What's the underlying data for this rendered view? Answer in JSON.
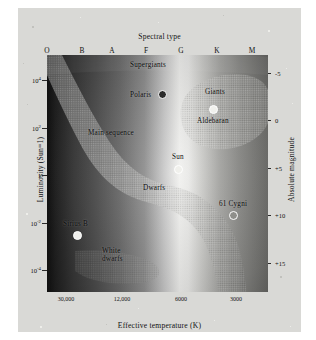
{
  "figure": {
    "kind": "hertzsprung-russell-diagram"
  },
  "axes": {
    "top_title": "Spectral type",
    "bottom_title": "Effective temperature (K)",
    "left_title": "Luminosity (Sun=1)",
    "right_title": "Absolute magnitude",
    "spectral_types": [
      "O",
      "B",
      "A",
      "F",
      "G",
      "K",
      "M"
    ],
    "left_ticks": [
      "10",
      "10",
      "1",
      "10",
      "10"
    ],
    "left_tick_exponents": [
      "4",
      "2",
      "",
      "-2",
      "-4"
    ],
    "right_ticks": [
      "-5",
      "0",
      "+5",
      "+10",
      "+15"
    ],
    "bottom_ticks": [
      "30,000",
      "12,000",
      "6000",
      "3000"
    ]
  },
  "regions": [
    {
      "name": "supergiants",
      "label": "Supergiants"
    },
    {
      "name": "giants",
      "label": "Giants"
    },
    {
      "name": "main-sequence",
      "label": "Main sequence"
    },
    {
      "name": "dwarfs",
      "label": "Dwarfs"
    },
    {
      "name": "white-dwarfs",
      "label": "White dwarfs"
    }
  ],
  "stars": [
    {
      "name": "polaris",
      "label": "Polaris"
    },
    {
      "name": "aldebaran",
      "label": "Aldebaran"
    },
    {
      "name": "sun",
      "label": "Sun"
    },
    {
      "name": "61-cygni",
      "label": "61 Cygni"
    },
    {
      "name": "sirius-b",
      "label": "Sirius B"
    }
  ],
  "chart_data": {
    "type": "scatter",
    "title": "Spectral type",
    "xlabel": "Effective temperature (K)",
    "ylabel": "Luminosity (Sun=1)",
    "y2label": "Absolute magnitude",
    "xlabel_top": "Spectral type",
    "grid": false,
    "legend": "none",
    "x_axis": {
      "scale": "log-reversed",
      "tick_labels": [
        "30,000",
        "12,000",
        "6000",
        "3000"
      ],
      "tick_values": [
        30000,
        12000,
        6000,
        3000
      ],
      "spectral_tick_labels": [
        "O",
        "B",
        "A",
        "F",
        "G",
        "K",
        "M"
      ],
      "range_k": [
        40000,
        2500
      ]
    },
    "y_axis": {
      "scale": "log",
      "tick_labels": [
        "10^4",
        "10^2",
        "1",
        "10^-2",
        "10^-4"
      ],
      "tick_values": [
        10000,
        100,
        1,
        0.01,
        0.0001
      ],
      "range": [
        3e-05,
        300000
      ]
    },
    "y2_axis": {
      "tick_labels": [
        "-5",
        "0",
        "+5",
        "+10",
        "+15"
      ],
      "tick_values": [
        -5,
        0,
        5,
        10,
        15
      ],
      "range": [
        -8,
        17
      ]
    },
    "points": [
      {
        "label": "Polaris",
        "spectral_type": "F",
        "temperature_k": 7000,
        "luminosity_sun": 2200,
        "absolute_magnitude": -3.6,
        "marker": "dark-ring"
      },
      {
        "label": "Aldebaran",
        "spectral_type": "K",
        "temperature_k": 3900,
        "luminosity_sun": 150,
        "absolute_magnitude": -0.6,
        "marker": "light"
      },
      {
        "label": "Sun",
        "spectral_type": "G",
        "temperature_k": 5800,
        "luminosity_sun": 1,
        "absolute_magnitude": 4.8,
        "marker": "light"
      },
      {
        "label": "61 Cygni",
        "spectral_type": "K",
        "temperature_k": 4300,
        "luminosity_sun": 0.085,
        "absolute_magnitude": 7.5,
        "marker": "mid-ring"
      },
      {
        "label": "Sirius B",
        "spectral_type": "A",
        "temperature_k": 9500,
        "luminosity_sun": 0.0025,
        "absolute_magnitude": 11.2,
        "marker": "light-ring"
      }
    ],
    "regions": [
      {
        "label": "Supergiants",
        "description": "horizontal band across the top of the diagram"
      },
      {
        "label": "Giants",
        "description": "rounded blob at upper right, cool and luminous"
      },
      {
        "label": "Main sequence",
        "description": "broad S-shaped diagonal band from hot-luminous upper left to cool-faint lower right"
      },
      {
        "label": "Dwarfs",
        "description": "label on lower portion of the main sequence band"
      },
      {
        "label": "White dwarfs",
        "description": "small wedge at lower left, hot and faint"
      }
    ]
  }
}
